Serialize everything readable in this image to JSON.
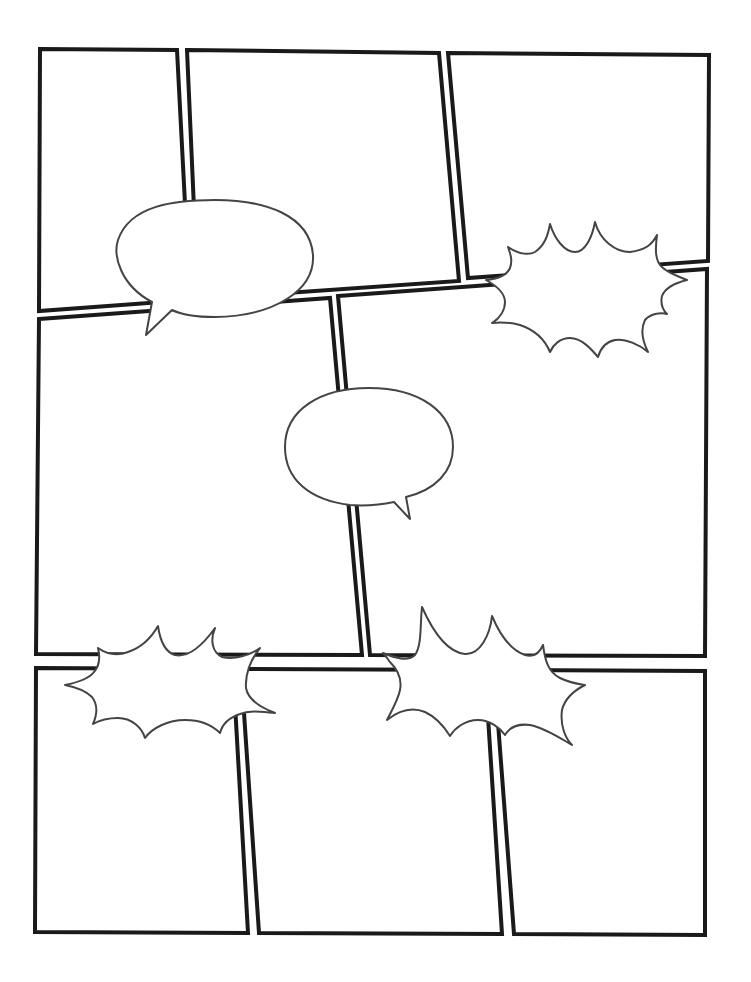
{
  "page": {
    "title": "Blank comic page template",
    "background": "#ffffff",
    "panel_border_color": "#1a1a1a",
    "balloon_stroke_color": "#444444"
  },
  "panels": [
    {
      "id": "panel-1",
      "row": 1,
      "points": "40,49 177,50 190,300 39,311"
    },
    {
      "id": "panel-2",
      "row": 1,
      "points": "187,50 439,53 459,281 198,299"
    },
    {
      "id": "panel-3",
      "row": 1,
      "points": "448,53 709,55 708,261 468,278"
    },
    {
      "id": "panel-4",
      "row": 2,
      "points": "39,319 330,298 362,655 36,654"
    },
    {
      "id": "panel-5",
      "row": 2,
      "points": "338,296 707,269 705,656 370,655"
    },
    {
      "id": "panel-6",
      "row": 3,
      "points": "36,668 233,669 248,933 35,932"
    },
    {
      "id": "panel-7",
      "row": 3,
      "points": "241,669 485,670 502,934 259,933"
    },
    {
      "id": "panel-8",
      "row": 3,
      "points": "494,670 705,671 705,935 514,934"
    }
  ],
  "balloons": {
    "speech_1": {
      "type": "speech",
      "text": "",
      "path": "M152,302 C 120,285 113,255 118,240 C 130,205 175,200 215,200 C 265,200 310,215 313,255 C 315,290 275,316 215,317 C 195,317 180,314 172,310 L146,335 Z"
    },
    "speech_2": {
      "type": "speech",
      "text": "",
      "path": "M394,502 C 380,505 365,506 350,505 C 310,500 285,480 285,447 C 285,410 320,388 369,388 C 420,388 453,412 453,447 C 453,472 435,490 406,497 L410,519 Z"
    },
    "burst_1": {
      "type": "burst",
      "text": "",
      "path": "M508,247 C 520,255 530,255 535,252 C 545,245 548,235 550,224 C 555,240 565,252 575,252 C 585,252 592,238 595,222 C 600,240 615,252 630,252 C 645,250 652,245 657,235 C 655,250 655,262 663,268 C 670,274 680,277 687,280 C 675,283 665,288 662,296 C 660,305 663,310 667,314 C 660,312 650,314 645,320 C 640,330 643,342 648,352 C 640,345 625,338 615,340 C 605,342 600,350 598,357 C 592,350 582,338 570,338 C 560,338 553,345 550,352 C 545,340 535,330 520,325 C 508,322 500,322 492,323 C 500,318 505,310 505,302 C 505,292 495,285 486,280 C 498,279 507,275 510,268 C 513,260 510,253 508,247 Z"
    },
    "burst_2": {
      "type": "burst",
      "text": "",
      "path": "M98,648 C 108,655 118,656 128,652 C 140,648 150,640 158,626 C 160,640 165,652 175,655 C 190,658 205,642 215,628 C 210,640 212,652 222,657 C 235,660 250,655 260,648 C 250,660 245,675 246,688 C 248,700 262,708 275,713 C 262,712 250,710 240,714 C 228,718 222,725 220,733 C 212,725 200,720 185,720 C 168,720 152,728 145,738 C 142,728 132,718 118,718 C 108,718 100,720 93,724 C 97,715 98,705 92,697 C 85,690 75,687 65,685 C 75,683 88,680 94,672 C 100,665 100,656 98,648 Z"
    },
    "burst_3": {
      "type": "burst",
      "text": "",
      "path": "M383,653 C 395,658 408,662 415,655 C 422,645 420,625 422,607 C 430,625 445,652 465,654 C 480,655 490,635 492,616 C 500,635 510,650 525,655 C 535,658 540,652 543,645 C 545,660 548,672 560,678 C 570,683 578,684 585,685 C 575,690 565,698 562,710 C 560,725 565,738 572,745 C 560,738 545,728 530,725 C 515,723 508,730 505,735 C 500,728 490,720 478,720 C 465,720 455,728 450,736 C 445,728 438,718 425,712 C 410,706 397,712 387,720 C 392,710 398,700 400,690 C 402,680 398,670 390,662 C 387,658 385,655 383,653 Z"
    }
  }
}
